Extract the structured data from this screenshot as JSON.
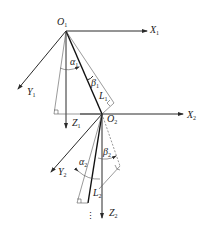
{
  "figure": {
    "type": "kinematic-link-diagram",
    "labels": {
      "O1": {
        "base": "O",
        "sub": "1"
      },
      "X1": {
        "base": "X",
        "sub": "1"
      },
      "Y1": {
        "base": "Y",
        "sub": "1"
      },
      "Z1": {
        "base": "Z",
        "sub": "1"
      },
      "alpha1": {
        "base": "α",
        "sub": "1"
      },
      "beta1": {
        "base": "β",
        "sub": "1"
      },
      "L1": {
        "base": "L",
        "sub": "1"
      },
      "O2": {
        "base": "O",
        "sub": "2"
      },
      "X2": {
        "base": "X",
        "sub": "2"
      },
      "Y2": {
        "base": "Y",
        "sub": "2"
      },
      "Z2": {
        "base": "Z",
        "sub": "2"
      },
      "alpha2": {
        "base": "α",
        "sub": "2"
      },
      "beta2": {
        "base": "β",
        "sub": "2"
      },
      "L2": {
        "base": "L",
        "sub": "2"
      },
      "continuation": "⋮"
    },
    "colors": {
      "line": "#2a2a2a",
      "background": "#ffffff"
    }
  }
}
